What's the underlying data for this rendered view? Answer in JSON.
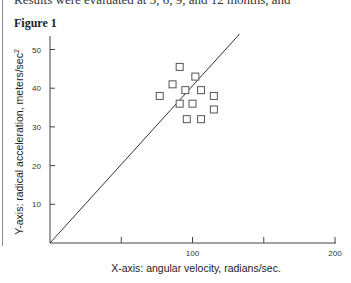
{
  "document": {
    "top_text": "Results were evaluated at 3, 6, 9, and 12 months, and",
    "figure_title": "Figure 1"
  },
  "chart_data": {
    "type": "scatter",
    "title": "Figure 1",
    "xlabel": "X-axis: angular velocity, radians/sec.",
    "ylabel": "Y-axis: radical acceleration, meters/sec²",
    "xlim": [
      0,
      200
    ],
    "ylim": [
      0,
      55
    ],
    "x_ticks": [
      50,
      100,
      150,
      200
    ],
    "x_tick_labels": [
      "",
      "100",
      "",
      "200"
    ],
    "y_ticks": [
      10,
      20,
      30,
      40,
      50
    ],
    "y_tick_labels": [
      "10",
      "20",
      "30",
      "40",
      "50"
    ],
    "grid": false,
    "legend": null,
    "series": [
      {
        "name": "observations",
        "marker": "open-square",
        "points": [
          {
            "x": 91,
            "y": 45.5
          },
          {
            "x": 102,
            "y": 43
          },
          {
            "x": 86,
            "y": 41
          },
          {
            "x": 95,
            "y": 39.5
          },
          {
            "x": 106,
            "y": 39.5
          },
          {
            "x": 77,
            "y": 38
          },
          {
            "x": 115,
            "y": 38
          },
          {
            "x": 91,
            "y": 36
          },
          {
            "x": 100,
            "y": 36
          },
          {
            "x": 115,
            "y": 34.5
          },
          {
            "x": 96,
            "y": 32
          },
          {
            "x": 106,
            "y": 32
          }
        ]
      },
      {
        "name": "reference line",
        "type": "line",
        "points": [
          {
            "x": 0,
            "y": 0
          },
          {
            "x": 133,
            "y": 54
          }
        ]
      }
    ]
  }
}
